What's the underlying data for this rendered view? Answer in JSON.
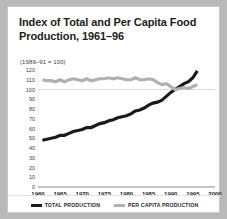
{
  "figure": {
    "title": "Index of Total and Per Capita Food Production, 1961–96",
    "subtitle": "(1989–91 = 100)"
  },
  "legend": {
    "items": [
      {
        "label": "TOTAL PRODUCTION",
        "color": "#1a1a1a",
        "icon": "line-swatch-icon"
      },
      {
        "label": "PER CAPITA PRODUCTION",
        "color": "#b0b0b0",
        "icon": "line-swatch-icon"
      }
    ]
  },
  "chart_data": {
    "type": "line",
    "title": "Index of Total and Per Capita Food Production, 1961–96",
    "subtitle": "(1989–91 = 100)",
    "xlabel": "",
    "ylabel": "",
    "xlim": [
      1960,
      2000
    ],
    "ylim": [
      0,
      120
    ],
    "xticks": [
      1960,
      1965,
      1970,
      1975,
      1980,
      1985,
      1990,
      1995,
      2000
    ],
    "yticks": [
      0,
      10,
      20,
      30,
      40,
      50,
      60,
      70,
      80,
      90,
      100,
      110,
      120
    ],
    "grid": false,
    "gridlines": [
      100
    ],
    "legend_position": "bottom",
    "x": [
      1961,
      1962,
      1963,
      1964,
      1965,
      1966,
      1967,
      1968,
      1969,
      1970,
      1971,
      1972,
      1973,
      1974,
      1975,
      1976,
      1977,
      1978,
      1979,
      1980,
      1981,
      1982,
      1983,
      1984,
      1985,
      1986,
      1987,
      1988,
      1989,
      1990,
      1991,
      1992,
      1993,
      1994,
      1995,
      1996
    ],
    "series": [
      {
        "name": "TOTAL PRODUCTION",
        "color": "#1a1a1a",
        "values": [
          48,
          49,
          50,
          51,
          53,
          53,
          55,
          57,
          58,
          59,
          61,
          61,
          63,
          65,
          66,
          68,
          69,
          71,
          72,
          73,
          75,
          78,
          79,
          81,
          84,
          86,
          87,
          89,
          93,
          97,
          100,
          103,
          106,
          108,
          112,
          119
        ]
      },
      {
        "name": "PER CAPITA PRODUCTION",
        "color": "#b0b0b0",
        "values": [
          110,
          109,
          109,
          108,
          110,
          108,
          110,
          111,
          110,
          109,
          111,
          109,
          110,
          111,
          111,
          112,
          111,
          112,
          111,
          110,
          110,
          112,
          110,
          110,
          111,
          110,
          107,
          105,
          106,
          103,
          100,
          101,
          102,
          101,
          103,
          105
        ]
      }
    ]
  }
}
